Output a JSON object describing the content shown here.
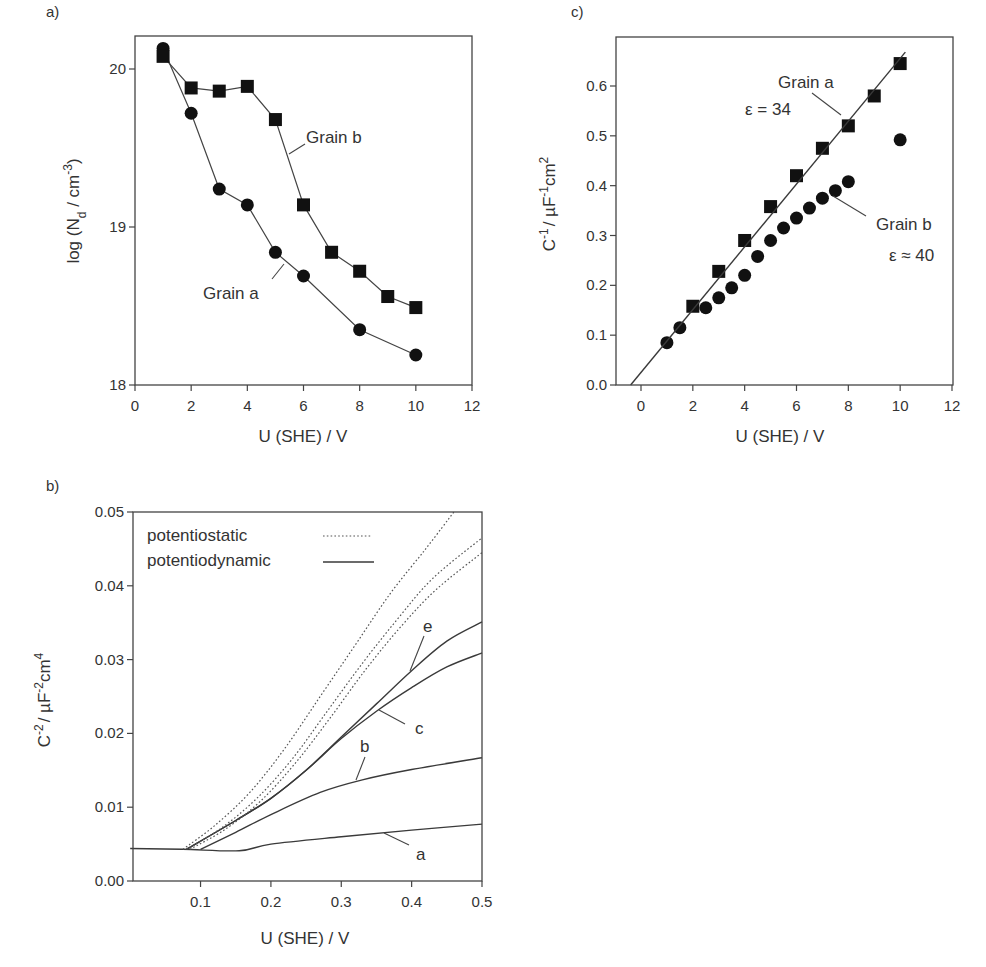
{
  "chart_data": [
    {
      "id": "a",
      "panel_label": "a)",
      "type": "scatter",
      "xlabel": "U (SHE) / V",
      "ylabel": "log (N_d / cm^-3)",
      "xlim": [
        0,
        12
      ],
      "ylim": [
        18,
        20.2
      ],
      "xticks": [
        0,
        2,
        4,
        6,
        8,
        10,
        12
      ],
      "yticks": [
        18,
        19,
        20
      ],
      "grid": false,
      "series": [
        {
          "name": "Grain a",
          "marker": "circle",
          "connected": true,
          "x": [
            1,
            2,
            3,
            4,
            5,
            6,
            8,
            10
          ],
          "y": [
            20.13,
            19.72,
            19.24,
            19.14,
            18.84,
            18.69,
            18.35,
            18.19
          ]
        },
        {
          "name": "Grain b",
          "marker": "square",
          "connected": true,
          "x": [
            1,
            2,
            3,
            4,
            5,
            6,
            7,
            8,
            9,
            10
          ],
          "y": [
            20.08,
            19.88,
            19.86,
            19.89,
            19.68,
            19.14,
            18.84,
            18.72,
            18.56,
            18.49
          ]
        }
      ],
      "annotations": [
        {
          "text": "Grain b",
          "x": 6.85,
          "y": 19.55,
          "leader": [
            [
              5.55,
              19.42
            ],
            [
              6.0,
              19.48
            ]
          ]
        },
        {
          "text": "Grain a",
          "x": 2.4,
          "y": 18.55,
          "leader": [
            [
              5.2,
              18.78
            ],
            [
              4.85,
              18.67
            ]
          ]
        }
      ]
    },
    {
      "id": "b",
      "panel_label": "b)",
      "type": "line",
      "xlabel": "U (SHE) / V",
      "ylabel": "C^-2 / µF^-2 cm^4",
      "xlim": [
        0.0,
        0.5
      ],
      "ylim": [
        0.0,
        0.05
      ],
      "xticks": [
        0.1,
        0.2,
        0.3,
        0.4,
        0.5
      ],
      "yticks": [
        0.0,
        0.01,
        0.02,
        0.03,
        0.04,
        0.05
      ],
      "ytick_labels": [
        "0.00",
        "0.01",
        "0.02",
        "0.03",
        "0.04",
        "0.05"
      ],
      "grid": false,
      "legend": [
        {
          "label": "potentiostatic",
          "style": "dotted"
        },
        {
          "label": "potentiodynamic",
          "style": "solid"
        }
      ],
      "legend_position": "upper left",
      "series": [
        {
          "name": "a",
          "style": "solid",
          "x": [
            0.0,
            0.075,
            0.155,
            0.2,
            0.3,
            0.4,
            0.5
          ],
          "y": [
            0.0044,
            0.0043,
            0.0041,
            0.005,
            0.006,
            0.0069,
            0.0077
          ]
        },
        {
          "name": "b",
          "style": "solid",
          "x": [
            0.1,
            0.15,
            0.2,
            0.27,
            0.33,
            0.4,
            0.5
          ],
          "y": [
            0.0043,
            0.0066,
            0.009,
            0.012,
            0.0137,
            0.0151,
            0.0167
          ]
        },
        {
          "name": "c",
          "style": "solid",
          "x": [
            0.08,
            0.15,
            0.2,
            0.25,
            0.3,
            0.35,
            0.4,
            0.45,
            0.5
          ],
          "y": [
            0.0043,
            0.0082,
            0.0112,
            0.015,
            0.0193,
            0.023,
            0.0262,
            0.029,
            0.0309
          ]
        },
        {
          "name": "e",
          "style": "solid",
          "x": [
            0.08,
            0.15,
            0.2,
            0.25,
            0.3,
            0.35,
            0.4,
            0.45,
            0.5
          ],
          "y": [
            0.0043,
            0.0082,
            0.0112,
            0.015,
            0.0195,
            0.024,
            0.0285,
            0.0325,
            0.0351
          ]
        },
        {
          "name": "potentiostatic 1",
          "style": "dotted",
          "x": [
            0.075,
            0.12,
            0.17,
            0.22,
            0.27,
            0.32,
            0.37,
            0.42,
            0.46
          ],
          "y": [
            0.0043,
            0.0075,
            0.012,
            0.018,
            0.025,
            0.032,
            0.039,
            0.045,
            0.05
          ]
        },
        {
          "name": "potentiostatic 2",
          "style": "dotted",
          "x": [
            0.08,
            0.13,
            0.18,
            0.23,
            0.28,
            0.33,
            0.38,
            0.43,
            0.5
          ],
          "y": [
            0.0043,
            0.0072,
            0.0112,
            0.0165,
            0.023,
            0.0295,
            0.0355,
            0.041,
            0.0465
          ]
        },
        {
          "name": "potentiostatic 3",
          "style": "dotted",
          "x": [
            0.085,
            0.135,
            0.185,
            0.235,
            0.285,
            0.335,
            0.385,
            0.435,
            0.5
          ],
          "y": [
            0.0043,
            0.007,
            0.0108,
            0.016,
            0.0222,
            0.0287,
            0.0345,
            0.0395,
            0.0445
          ]
        }
      ],
      "annotations": [
        {
          "text": "e",
          "x": 0.415,
          "y": 0.0345
        },
        {
          "text": "c",
          "x": 0.42,
          "y": 0.0208
        },
        {
          "text": "b",
          "x": 0.333,
          "y": 0.0178
        },
        {
          "text": "a",
          "x": 0.42,
          "y": 0.0036
        }
      ]
    },
    {
      "id": "c",
      "panel_label": "c)",
      "type": "scatter",
      "xlabel": "U (SHE) / V",
      "ylabel": "C^-1 / µF^-1 cm^2",
      "xlim": [
        -1,
        12
      ],
      "ylim": [
        0.0,
        0.7
      ],
      "xticks": [
        0,
        2,
        4,
        6,
        8,
        10,
        12
      ],
      "yticks": [
        0.0,
        0.1,
        0.2,
        0.3,
        0.4,
        0.5,
        0.6
      ],
      "ytick_labels": [
        "0.0",
        "0.1",
        "0.2",
        "0.3",
        "0.4",
        "0.5",
        "0.6"
      ],
      "grid": false,
      "series": [
        {
          "name": "Grain a",
          "marker": "square",
          "epsilon": "ε = 34",
          "x": [
            2,
            3,
            4,
            5,
            6,
            7,
            8,
            9,
            10
          ],
          "y": [
            0.158,
            0.228,
            0.29,
            0.358,
            0.42,
            0.475,
            0.52,
            0.58,
            0.645
          ]
        },
        {
          "name": "Grain b",
          "marker": "circle",
          "epsilon": "ε ≈ 40",
          "x": [
            1,
            1.5,
            2.5,
            3,
            3.5,
            4,
            4.5,
            5,
            5.5,
            6,
            6.5,
            7,
            7.5,
            8,
            10
          ],
          "y": [
            0.085,
            0.115,
            0.155,
            0.175,
            0.195,
            0.22,
            0.258,
            0.29,
            0.315,
            0.335,
            0.355,
            0.375,
            0.39,
            0.408,
            0.492
          ]
        },
        {
          "name": "Grain a fit",
          "style": "solid",
          "x": [
            -0.4,
            10.2
          ],
          "y": [
            0.0,
            0.668
          ]
        }
      ],
      "annotations": [
        {
          "text": "Grain a",
          "x": 6.5,
          "y": 0.607
        },
        {
          "text": "ε = 34",
          "x": 4.2,
          "y": 0.555
        },
        {
          "text": "Grain b",
          "x": 9.0,
          "y": 0.323
        },
        {
          "text": "ε ≈ 40",
          "x": 9.9,
          "y": 0.26
        }
      ]
    }
  ],
  "labels": {
    "a": {
      "panel": "a)",
      "x_title": "U (SHE) / V",
      "y_main": "log (N",
      "y_sub": "d",
      "y_mid": " / cm",
      "y_sup": "-3",
      "y_end": ")",
      "ann_b": "Grain b",
      "ann_a": "Grain a"
    },
    "b": {
      "panel": "b)",
      "x_title": "U (SHE) / V",
      "y_c": "C",
      "y_sup1": "-2",
      "y_mid": "/ µF",
      "y_sup2": "-2",
      "y_cm": "cm",
      "y_sup3": "4",
      "legend1": "potentiostatic",
      "legend2": "potentiodynamic",
      "ann_e": "e",
      "ann_c": "c",
      "ann_b": "b",
      "ann_a": "a"
    },
    "c": {
      "panel": "c)",
      "x_title": "U (SHE) / V",
      "y_c": "C",
      "y_sup1": "-1",
      "y_mid": "/ µF",
      "y_sup2": "-1",
      "y_cm": "cm",
      "y_sup3": "2",
      "ann_a": "Grain a",
      "eps_a": "ε = 34",
      "ann_b": "Grain b",
      "eps_b": "ε ≈ 40"
    }
  }
}
